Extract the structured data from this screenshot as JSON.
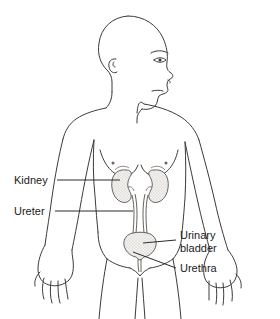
{
  "figure": {
    "background_color": "#ffffff",
    "outline_color": "#3a3a3a",
    "leader_line_color": "#2b2b2b",
    "organ_fill": "#f2f0ee",
    "organ_stipple_color": "#8a8580",
    "label_text_color": "#1a1a1a",
    "label_font_size_px": 11
  },
  "labels": [
    {
      "id": "kidney",
      "text": "Kidney",
      "x": 14,
      "y": 184,
      "anchor": "start",
      "leader": {
        "from_x": 57,
        "from_y": 180,
        "to_x": 120,
        "to_y": 180
      }
    },
    {
      "id": "ureter",
      "text": "Ureter",
      "x": 14,
      "y": 215,
      "anchor": "start",
      "leader": {
        "from_x": 55,
        "from_y": 211,
        "to_x": 133,
        "to_y": 211
      }
    },
    {
      "id": "urinary-bladder",
      "text_line1": "Urinary",
      "text_line2": "bladder",
      "x": 180,
      "y": 239,
      "anchor": "start",
      "leader": {
        "from_x": 176,
        "from_y": 240,
        "to_x": 143,
        "to_y": 243
      }
    },
    {
      "id": "urethra",
      "text": "Urethra",
      "x": 180,
      "y": 272,
      "anchor": "start",
      "leader": {
        "from_x": 176,
        "from_y": 268,
        "to_x": 133,
        "to_y": 252
      }
    }
  ],
  "organs": [
    {
      "id": "kidney-left",
      "name": "Kidney",
      "cx": 122,
      "cy": 185
    },
    {
      "id": "kidney-right",
      "name": "Kidney",
      "cx": 160,
      "cy": 185
    },
    {
      "id": "ureter-left",
      "name": "Ureter",
      "cx": 126,
      "cy": 215
    },
    {
      "id": "ureter-right",
      "name": "Ureter",
      "cx": 156,
      "cy": 215
    },
    {
      "id": "bladder",
      "name": "Urinary bladder",
      "cx": 140,
      "cy": 242
    },
    {
      "id": "urethra",
      "name": "Urethra",
      "cx": 140,
      "cy": 256
    }
  ]
}
